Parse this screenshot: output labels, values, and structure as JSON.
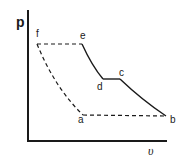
{
  "diagram": {
    "type": "p-v cycle diagram",
    "axes": {
      "y_label": "p",
      "x_label": "υ"
    },
    "points": {
      "a": {
        "label": "a",
        "x": 83,
        "y": 115
      },
      "b": {
        "label": "b",
        "x": 166,
        "y": 116
      },
      "c": {
        "label": "c",
        "x": 120,
        "y": 79
      },
      "d": {
        "label": "d",
        "x": 103,
        "y": 79
      },
      "e": {
        "label": "e",
        "x": 82,
        "y": 44
      },
      "f": {
        "label": "f",
        "x": 37,
        "y": 44
      }
    },
    "segments": [
      {
        "from": "e",
        "to": "d",
        "style": "solid"
      },
      {
        "from": "d",
        "to": "c",
        "style": "solid"
      },
      {
        "from": "c",
        "to": "b",
        "style": "solid"
      },
      {
        "from": "b",
        "to": "a",
        "style": "dashed"
      },
      {
        "from": "a",
        "to": "f",
        "style": "dashed"
      },
      {
        "from": "f",
        "to": "e",
        "style": "dashed"
      }
    ],
    "colors": {
      "line": "#1a1a1a",
      "background": "#ffffff"
    }
  }
}
